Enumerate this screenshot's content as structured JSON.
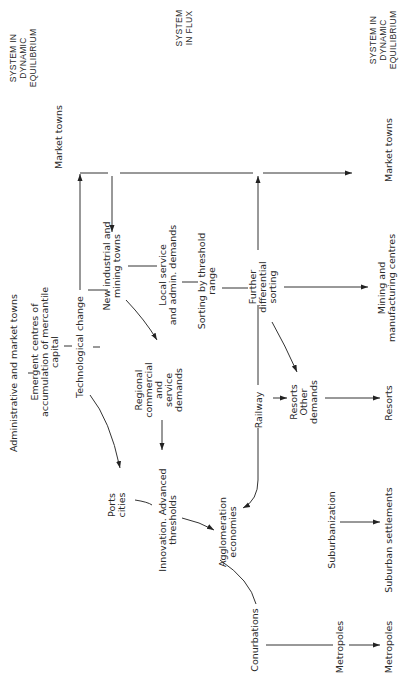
{
  "diagram": {
    "orientation": "rotated-90-ccw",
    "headers": {
      "left": [
        "SYSTEM  IN",
        "DYNAMIC",
        "EQUILIBRIUM"
      ],
      "middle": [
        "SYSTEM",
        "IN  FLUX"
      ],
      "right": [
        "SYSTEM  IN",
        "DYNAMIC",
        "EQUILIBRIUM"
      ]
    },
    "nodes": {
      "market_towns_start": "Market  towns",
      "admin_market_towns": "Administrative  and  market  towns",
      "emergent_centres": [
        "Emergent  centres  of",
        "accumulation  of  mercantile",
        "capital"
      ],
      "technological_change": "Technological  change",
      "new_industrial": [
        "New  industrial  and",
        "mining  towns"
      ],
      "local_service": [
        "Local  service",
        "and  admin. demands"
      ],
      "sorting_threshold": [
        "Sorting  by  threshold",
        "range"
      ],
      "further_sorting": [
        "Further",
        "differential",
        "sorting"
      ],
      "regional_commercial": [
        "Regional",
        "commercial",
        "and",
        "service",
        "demands"
      ],
      "ports_cities": [
        "Ports",
        "cities"
      ],
      "innovation": [
        "Innovation. Advanced",
        "thresholds"
      ],
      "railway": "Railway",
      "resorts_other": [
        "Resorts",
        "Other",
        "demands"
      ],
      "agglomeration": [
        "Agglomeration",
        "economies"
      ],
      "suburbanization": "Suburbanization",
      "conurbations": "Conurbations",
      "metropoles_mid": "Metropoles",
      "market_towns_end": "Market  towns",
      "mining_manufacturing": [
        "Mining  and",
        "manufacturing  centres"
      ],
      "resorts_end": "Resorts",
      "suburban_settlements": "Suburban  settlements",
      "metropoles_end": "Metropoles"
    }
  }
}
